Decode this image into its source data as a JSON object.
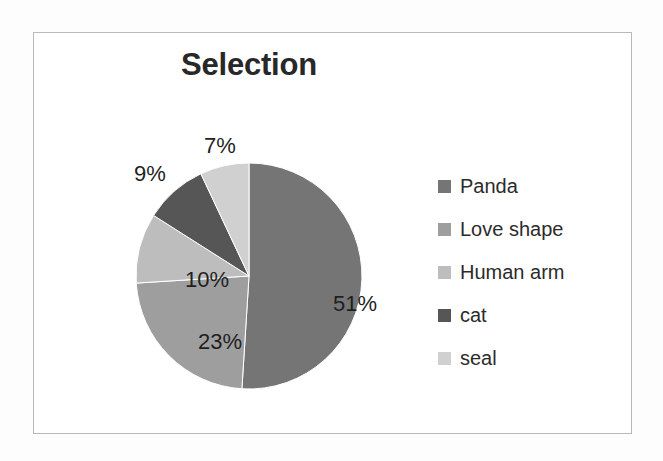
{
  "frame": {
    "border_color": "#b9b9b9",
    "background": "#ffffff"
  },
  "chart_data": {
    "type": "pie",
    "title": "Selection",
    "xlabel": "",
    "ylabel": "",
    "legend_position": "right",
    "grid": false,
    "categories": [
      "Panda",
      "Love shape",
      "Human arm",
      "cat",
      "seal"
    ],
    "values": [
      51,
      23,
      10,
      9,
      7
    ],
    "value_labels": [
      "51%",
      "23%",
      "10%",
      "9%",
      "7%"
    ],
    "colors": [
      "#757575",
      "#9e9e9e",
      "#bdbdbd",
      "#565656",
      "#d0d0d0"
    ],
    "start_angle_deg": 0,
    "direction": "clockwise",
    "units": "percent",
    "slices": [
      {
        "label": "Panda",
        "value": 51,
        "display": "51%",
        "color": "#757575",
        "label_placement": "inside"
      },
      {
        "label": "Love shape",
        "value": 23,
        "display": "23%",
        "color": "#9e9e9e",
        "label_placement": "inside"
      },
      {
        "label": "Human arm",
        "value": 10,
        "display": "10%",
        "color": "#bdbdbd",
        "label_placement": "inside"
      },
      {
        "label": "cat",
        "value": 9,
        "display": "9%",
        "color": "#565656",
        "label_placement": "outside"
      },
      {
        "label": "seal",
        "value": 7,
        "display": "7%",
        "color": "#d0d0d0",
        "label_placement": "outside"
      }
    ]
  },
  "legend": {
    "items": [
      {
        "label": "Panda",
        "color": "#757575"
      },
      {
        "label": "Love shape",
        "color": "#9e9e9e"
      },
      {
        "label": "Human arm",
        "color": "#bdbdbd"
      },
      {
        "label": "cat",
        "color": "#565656"
      },
      {
        "label": "seal",
        "color": "#d0d0d0"
      }
    ]
  }
}
